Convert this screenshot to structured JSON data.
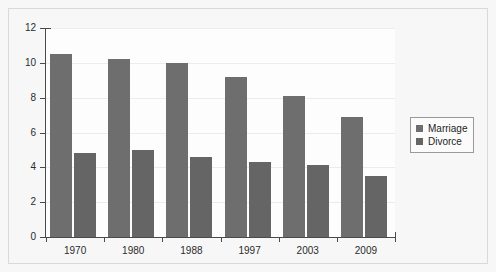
{
  "chart_data": {
    "type": "bar",
    "title": "",
    "xlabel": "",
    "ylabel": "",
    "categories": [
      "1970",
      "1980",
      "1988",
      "1997",
      "2003",
      "2009"
    ],
    "series": [
      {
        "name": "Marriage",
        "color": "#6e6e6e",
        "values": [
          10.5,
          10.2,
          10.0,
          9.2,
          8.1,
          6.9
        ]
      },
      {
        "name": "Divorce",
        "color": "#656565",
        "values": [
          4.8,
          5.0,
          4.6,
          4.3,
          4.15,
          3.5
        ]
      }
    ],
    "ylim": [
      0,
      12
    ],
    "yticks": [
      0,
      2,
      4,
      6,
      8,
      10,
      12
    ],
    "ytick_labels": [
      "0",
      "2",
      "4",
      "6",
      "8",
      "10",
      "12"
    ],
    "grid": true,
    "legend_position": "right"
  },
  "legend": {
    "items": [
      {
        "label": "Marriage"
      },
      {
        "label": "Divorce"
      }
    ]
  }
}
